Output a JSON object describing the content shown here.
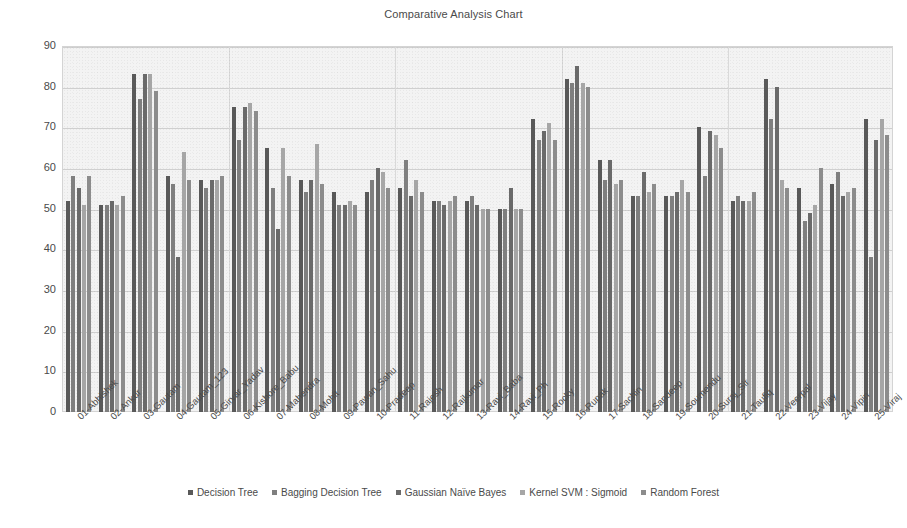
{
  "chart_data": {
    "type": "bar",
    "title": "Comparative Analysis Chart",
    "xlabel": "",
    "ylabel": "",
    "ylim": [
      0,
      90
    ],
    "ytick_step": 10,
    "yticks": [
      0,
      10,
      20,
      30,
      40,
      50,
      60,
      70,
      80,
      90
    ],
    "grid": true,
    "legend_position": "bottom",
    "categories": [
      "01-Abhishek",
      "02-Ankur",
      "03-Gautam",
      "04-Gautam_123",
      "05-Girvar_Yadav",
      "06-Kishore_Babu",
      "07-Mahendra",
      "08-Mohit",
      "09-Pawan_Sahu",
      "10-Pradeep",
      "11-Rajesh",
      "12-Rajkumar",
      "13-Ravi_Baba",
      "14-Ravi_Ph",
      "15-Rocky",
      "16-Rupak",
      "17-Sachin",
      "18-Sandeep",
      "19-Soumendu",
      "20-Suraj_Sir",
      "21-Taufiq",
      "22-Veerpal",
      "23-Vijay",
      "24-Vipin",
      "25-Viraj"
    ],
    "series": [
      {
        "name": "Decision Tree",
        "color": "#595959",
        "values": [
          52,
          51,
          83,
          58,
          57,
          75,
          65,
          57,
          54,
          54,
          55,
          52,
          52,
          50,
          72,
          82,
          62,
          53,
          53,
          70,
          52,
          82,
          55,
          56,
          72
        ]
      },
      {
        "name": "Bagging Decision Tree",
        "color": "#7f7f7f",
        "values": [
          58,
          51,
          77,
          56,
          55,
          67,
          55,
          54,
          51,
          57,
          62,
          52,
          53,
          50,
          67,
          81,
          57,
          53,
          53,
          58,
          53,
          72,
          47,
          59,
          38
        ]
      },
      {
        "name": "Gaussian Naïve Bayes",
        "color": "#6a6a6a",
        "values": [
          55,
          52,
          83,
          38,
          57,
          75,
          45,
          57,
          51,
          60,
          53,
          51,
          51,
          55,
          69,
          85,
          62,
          59,
          54,
          69,
          52,
          80,
          49,
          53,
          67
        ]
      },
      {
        "name": "Kernel SVM : Sigmoid",
        "color": "#a6a6a6",
        "values": [
          51,
          51,
          83,
          64,
          57,
          76,
          65,
          66,
          52,
          59,
          57,
          52,
          50,
          50,
          71,
          81,
          56,
          54,
          57,
          68,
          52,
          57,
          51,
          54,
          72
        ]
      },
      {
        "name": "Random Forest",
        "color": "#8c8c8c",
        "values": [
          58,
          53,
          79,
          57,
          58,
          74,
          58,
          56,
          51,
          55,
          54,
          53,
          50,
          50,
          67,
          80,
          57,
          56,
          54,
          65,
          54,
          55,
          60,
          55,
          68
        ]
      }
    ]
  },
  "legend": {
    "marker": "▪"
  }
}
